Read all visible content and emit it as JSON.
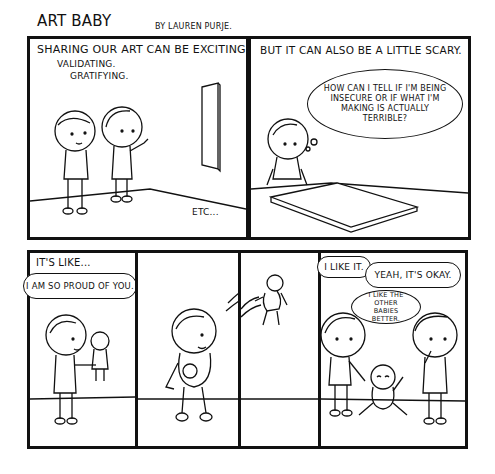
{
  "header": {
    "title": "ART BABY",
    "byline": "BY LAUREN PURJE."
  },
  "panels": [
    {
      "caption": "SHARING OUR ART CAN BE EXCITING.",
      "sub_captions": [
        "VALIDATING.",
        "GRATIFYING."
      ],
      "footer": "ETC..."
    },
    {
      "caption": "BUT IT CAN ALSO BE A LITTLE SCARY.",
      "thought_bubble": [
        "HOW CAN I TELL IF I'M BEING",
        "INSECURE OR IF WHAT I'M",
        "MAKING IS ACTUALLY",
        "TERRIBLE?"
      ]
    },
    {
      "caption": "IT'S LIKE...",
      "speech_bubble": "I AM SO PROUD OF YOU."
    },
    {
      "caption": ""
    },
    {
      "caption": ""
    },
    {
      "speech_bubbles": [
        "I LIKE IT.",
        "YEAH, IT'S OKAY.",
        "I LIKE THE OTHER BABIES BETTER."
      ]
    }
  ]
}
